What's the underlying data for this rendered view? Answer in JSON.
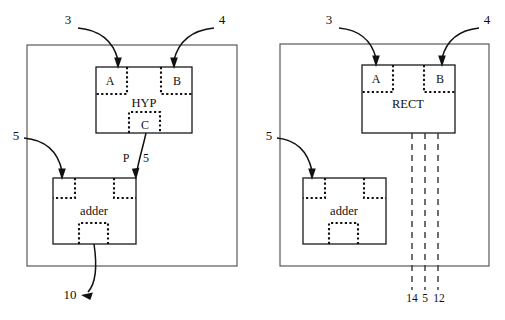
{
  "figure": {
    "title": "",
    "background_color": "#ffffff",
    "line_color": "#111111",
    "frame_color": "#4a4a4a",
    "width": 505,
    "height": 320
  },
  "panels": [
    {
      "id": "left-panel",
      "frame": {
        "x": 27,
        "y": 45,
        "w": 210,
        "h": 221
      },
      "main_unit": {
        "name": "HYP",
        "label": "HYP",
        "x": 96,
        "y": 67,
        "w": 96,
        "h": 66,
        "label_x": 144,
        "label_y": 107,
        "ports": [
          {
            "name": "A",
            "label": "A",
            "x": 96,
            "y": 67,
            "w": 31,
            "h": 27,
            "label_x": 110,
            "label_y": 85
          },
          {
            "name": "B",
            "label": "B",
            "x": 161,
            "y": 67,
            "w": 31,
            "h": 27,
            "label_x": 177,
            "label_y": 85
          },
          {
            "name": "C",
            "label": "C",
            "x": 129,
            "y": 112,
            "w": 31,
            "h": 21,
            "label_x": 145,
            "label_y": 128
          }
        ]
      },
      "adder_unit": {
        "name": "adder",
        "label": "adder",
        "x": 53,
        "y": 178,
        "w": 83,
        "h": 66,
        "label_x": 94,
        "label_y": 214,
        "ports": [
          {
            "name": "in-left",
            "x": 53,
            "y": 178,
            "w": 22,
            "h": 20
          },
          {
            "name": "in-right",
            "x": 114,
            "y": 178,
            "w": 22,
            "h": 20
          },
          {
            "name": "out",
            "x": 79,
            "y": 223,
            "w": 29,
            "h": 21
          }
        ]
      },
      "annotations": [
        {
          "name": "ref-3",
          "text": "3",
          "x": 68,
          "y": 24
        },
        {
          "name": "ref-4",
          "text": "4",
          "x": 222,
          "y": 24
        },
        {
          "name": "ref-5-left",
          "text": "5",
          "x": 16,
          "y": 140
        },
        {
          "name": "signal-P",
          "text": "P",
          "x": 125,
          "y": 161
        },
        {
          "name": "signal-5",
          "text": "5",
          "x": 144,
          "y": 161
        },
        {
          "name": "ref-10",
          "text": "10",
          "x": 70,
          "y": 299
        }
      ]
    },
    {
      "id": "right-panel",
      "frame": {
        "x": 280,
        "y": 44,
        "w": 209,
        "h": 222
      },
      "main_unit": {
        "name": "RECT",
        "label": "RECT",
        "x": 362,
        "y": 65,
        "w": 93,
        "h": 68,
        "label_x": 408,
        "label_y": 107,
        "ports": [
          {
            "name": "A",
            "label": "A",
            "x": 362,
            "y": 65,
            "w": 31,
            "h": 27,
            "label_x": 375,
            "label_y": 83
          },
          {
            "name": "B",
            "label": "B",
            "x": 424,
            "y": 65,
            "w": 31,
            "h": 27,
            "label_x": 440,
            "label_y": 83
          }
        ]
      },
      "adder_unit": {
        "name": "adder",
        "label": "adder",
        "x": 303,
        "y": 178,
        "w": 83,
        "h": 66,
        "label_x": 344,
        "label_y": 214,
        "ports": [
          {
            "name": "in-left",
            "x": 303,
            "y": 178,
            "w": 22,
            "h": 20
          },
          {
            "name": "in-right",
            "x": 364,
            "y": 178,
            "w": 22,
            "h": 20
          },
          {
            "name": "out",
            "x": 329,
            "y": 223,
            "w": 29,
            "h": 21
          }
        ]
      },
      "bus_lines": [
        {
          "name": "bus-14",
          "x": 412,
          "label": "14",
          "label_x": 412,
          "label_y": 301
        },
        {
          "name": "bus-5",
          "x": 425,
          "label": "5",
          "label_x": 425,
          "label_y": 301
        },
        {
          "name": "bus-12",
          "x": 438,
          "label": "12",
          "label_x": 438,
          "label_y": 301
        }
      ],
      "bus_top": 133,
      "bus_bottom": 290,
      "annotations": [
        {
          "name": "ref-3",
          "text": "3",
          "x": 329,
          "y": 24
        },
        {
          "name": "ref-4",
          "text": "4",
          "x": 487,
          "y": 24
        },
        {
          "name": "ref-5-left",
          "text": "5",
          "x": 269,
          "y": 140
        }
      ]
    }
  ],
  "connectors": {
    "left_ref3_arrow": "M 78 28 C 96 30 112 40 118 62",
    "left_ref4_arrow": "M 214 28 C 196 30 180 40 174 62",
    "left_ref5_arrow": "M 24 138 C 45 140 58 152 62 172",
    "left_p5_line": "M 145 133 C 142 146 140 158 138 174",
    "left_out_arrow": "M 94 244 C 96 262 96 278 86 292",
    "right_ref3_arrow": "M 339 28 C 356 30 370 40 376 58",
    "right_ref4_arrow": "M 479 28 C 462 30 448 40 442 58",
    "right_ref5_arrow": "M 277 138 C 296 140 308 152 312 172"
  }
}
